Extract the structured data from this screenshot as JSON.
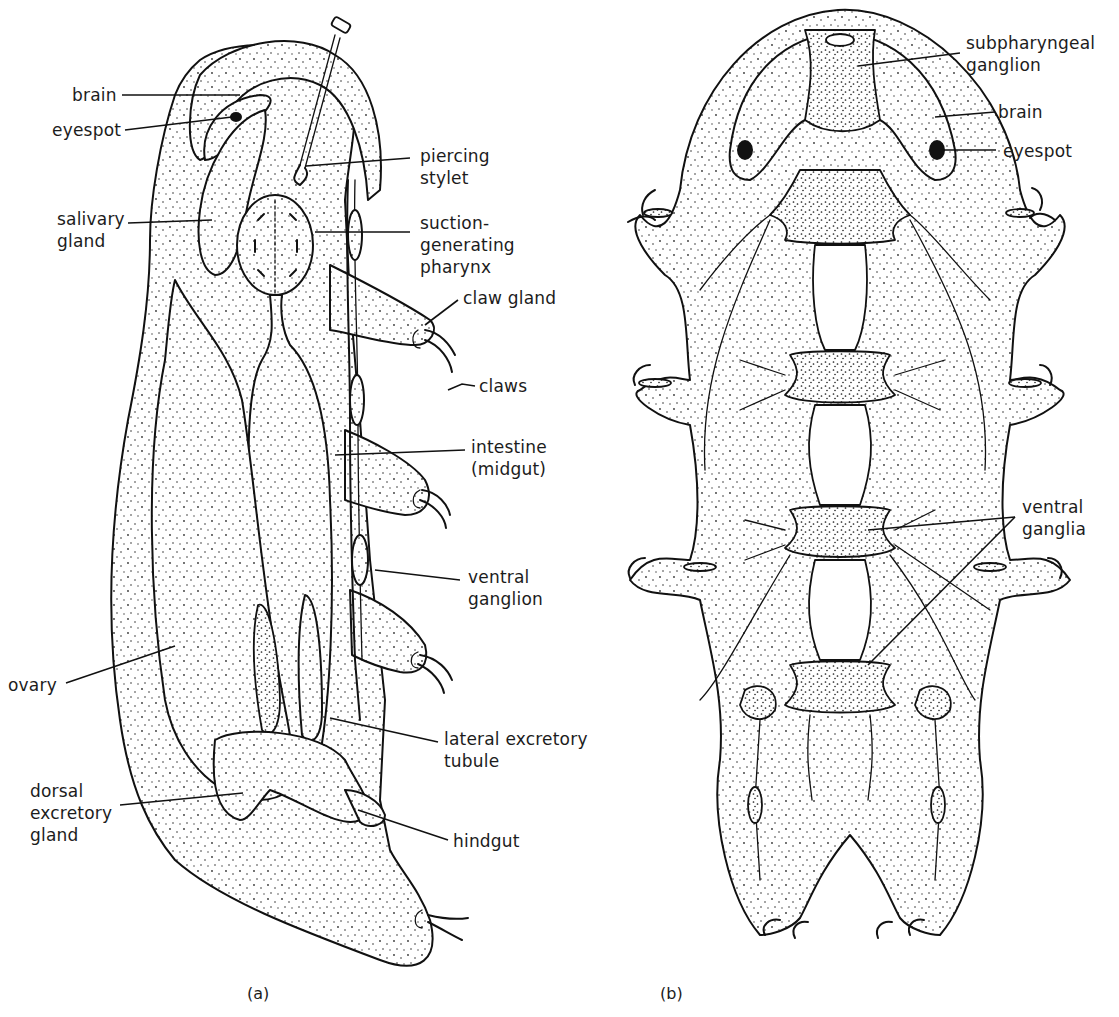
{
  "figure": {
    "panels": [
      {
        "id": "a",
        "caption": "(a)",
        "view": "lateral",
        "labels": {
          "brain": "brain",
          "eyespot": "eyespot",
          "salivary_gland": "salivary\ngland",
          "piercing_stylet": "piercing\nstylet",
          "suction_pharynx": "suction-\ngenerating\npharynx",
          "claw_gland": "claw gland",
          "claws": "claws",
          "intestine": "intestine\n(midgut)",
          "ventral_ganglion": "ventral\nganglion",
          "ovary": "ovary",
          "lateral_excretory_tubule": "lateral excretory\ntubule",
          "dorsal_excretory_gland": "dorsal\nexcretory\ngland",
          "hindgut": "hindgut"
        }
      },
      {
        "id": "b",
        "caption": "(b)",
        "view": "ventral",
        "labels": {
          "subpharyngeal_ganglion": "subpharyngeal\nganglion",
          "brain": "brain",
          "eyespot": "eyespot",
          "ventral_ganglia": "ventral\nganglia"
        }
      }
    ]
  }
}
